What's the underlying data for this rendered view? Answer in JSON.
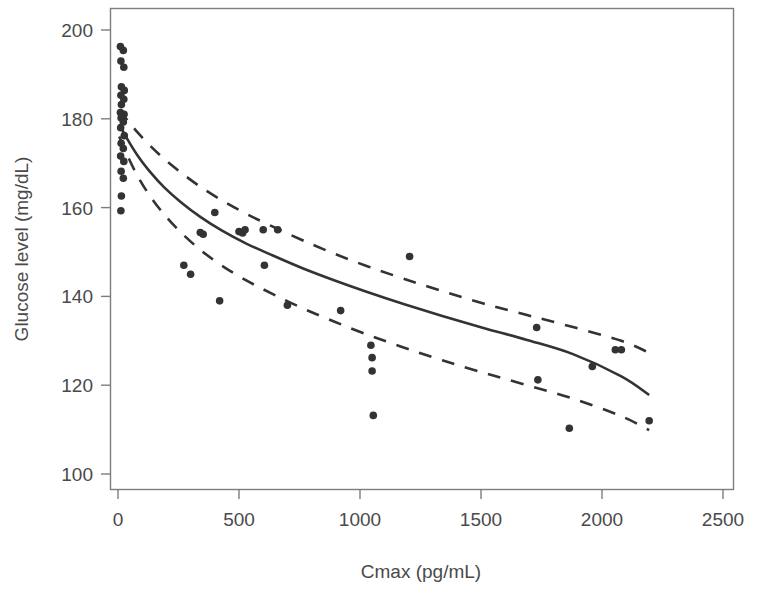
{
  "chart_data": {
    "type": "scatter",
    "title": "",
    "xlabel": "Cmax (pg/mL)",
    "ylabel": "Glucose level (mg/dL)",
    "xlim": [
      0,
      2500
    ],
    "ylim": [
      100,
      200
    ],
    "xticks": [
      0,
      500,
      1000,
      1500,
      2000,
      2500
    ],
    "yticks": [
      100,
      120,
      140,
      160,
      180,
      200
    ],
    "xtick_labels": [
      "0",
      "500",
      "1000",
      "1500",
      "2000",
      "2500"
    ],
    "ytick_labels": [
      "100",
      "120",
      "140",
      "160",
      "180",
      "200"
    ],
    "grid": false,
    "legend": "none",
    "marker": {
      "shape": "circle",
      "color": "#333333",
      "size": 7
    },
    "points": [
      {
        "x": 10,
        "y": 196.3
      },
      {
        "x": 22,
        "y": 195.4
      },
      {
        "x": 12,
        "y": 193.0
      },
      {
        "x": 24,
        "y": 191.6
      },
      {
        "x": 14,
        "y": 187.2
      },
      {
        "x": 26,
        "y": 186.4
      },
      {
        "x": 12,
        "y": 185.3
      },
      {
        "x": 24,
        "y": 184.4
      },
      {
        "x": 14,
        "y": 183.2
      },
      {
        "x": 10,
        "y": 181.4
      },
      {
        "x": 25,
        "y": 181.0
      },
      {
        "x": 13,
        "y": 180.2
      },
      {
        "x": 22,
        "y": 179.3
      },
      {
        "x": 11,
        "y": 178.0
      },
      {
        "x": 26,
        "y": 176.2
      },
      {
        "x": 13,
        "y": 174.5
      },
      {
        "x": 22,
        "y": 173.3
      },
      {
        "x": 11,
        "y": 171.6
      },
      {
        "x": 24,
        "y": 170.4
      },
      {
        "x": 13,
        "y": 168.2
      },
      {
        "x": 22,
        "y": 166.6
      },
      {
        "x": 14,
        "y": 162.6
      },
      {
        "x": 12,
        "y": 159.3
      },
      {
        "x": 272,
        "y": 147.0
      },
      {
        "x": 300,
        "y": 145.0
      },
      {
        "x": 340,
        "y": 154.4
      },
      {
        "x": 352,
        "y": 154.0
      },
      {
        "x": 400,
        "y": 158.9
      },
      {
        "x": 420,
        "y": 139.0
      },
      {
        "x": 500,
        "y": 154.6
      },
      {
        "x": 515,
        "y": 154.3
      },
      {
        "x": 525,
        "y": 155.0
      },
      {
        "x": 600,
        "y": 155.0
      },
      {
        "x": 605,
        "y": 147.0
      },
      {
        "x": 660,
        "y": 155.0
      },
      {
        "x": 700,
        "y": 138.0
      },
      {
        "x": 920,
        "y": 136.8
      },
      {
        "x": 1045,
        "y": 129.0
      },
      {
        "x": 1050,
        "y": 126.2
      },
      {
        "x": 1050,
        "y": 123.2
      },
      {
        "x": 1055,
        "y": 113.2
      },
      {
        "x": 1205,
        "y": 149.0
      },
      {
        "x": 1730,
        "y": 133.0
      },
      {
        "x": 1735,
        "y": 121.2
      },
      {
        "x": 1865,
        "y": 110.3
      },
      {
        "x": 1960,
        "y": 124.2
      },
      {
        "x": 2055,
        "y": 128.0
      },
      {
        "x": 2080,
        "y": 128.0
      },
      {
        "x": 2195,
        "y": 112.0
      }
    ],
    "series": [
      {
        "name": "fitted curve",
        "style": "solid",
        "color": "#333333",
        "x": [
          5,
          40,
          80,
          130,
          190,
          260,
          340,
          430,
          530,
          640,
          760,
          890,
          1030,
          1180,
          1340,
          1510,
          1690,
          1880,
          2080,
          2195
        ],
        "y": [
          178.8,
          175.3,
          171.8,
          168.2,
          164.6,
          161.2,
          157.9,
          154.8,
          151.9,
          149.2,
          146.4,
          143.7,
          141.0,
          138.3,
          135.6,
          132.9,
          130.2,
          127.0,
          122.0,
          117.8
        ]
      },
      {
        "name": "upper confidence band",
        "style": "dashed",
        "color": "#333333",
        "x": [
          5,
          40,
          80,
          130,
          190,
          260,
          340,
          430,
          530,
          640,
          760,
          890,
          1030,
          1180,
          1340,
          1510,
          1690,
          1880,
          2080,
          2195
        ],
        "y": [
          182.0,
          179.6,
          177.0,
          174.1,
          171.0,
          167.9,
          164.7,
          161.6,
          158.6,
          155.7,
          152.7,
          149.7,
          146.8,
          144.0,
          141.2,
          138.4,
          135.8,
          133.1,
          130.0,
          127.3
        ]
      },
      {
        "name": "lower confidence band",
        "style": "dashed",
        "color": "#333333",
        "x": [
          5,
          40,
          80,
          130,
          190,
          260,
          340,
          430,
          530,
          640,
          760,
          890,
          1030,
          1180,
          1340,
          1510,
          1690,
          1880,
          2080,
          2195
        ],
        "y": [
          176.0,
          171.6,
          167.2,
          162.8,
          158.5,
          154.4,
          150.5,
          146.9,
          143.6,
          140.5,
          137.4,
          134.4,
          131.4,
          128.5,
          125.6,
          122.8,
          120.0,
          117.0,
          113.0,
          109.9
        ]
      }
    ]
  },
  "figure": {
    "background": "#ffffff",
    "frame_color": "#7d7d7d",
    "tick_color": "#7d7d7d",
    "text_color": "#4a4a4a"
  }
}
